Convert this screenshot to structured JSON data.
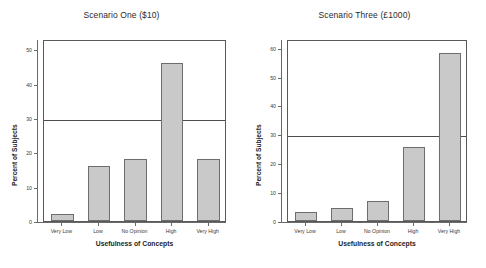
{
  "figure": {
    "width": 486,
    "height": 268,
    "background": "#ffffff",
    "bar_fill": "#c9c9c9",
    "bar_edge": "#6d6d6d",
    "axis_color": "#6a6a6a",
    "refline_color": "#4d4d4d"
  },
  "chart_data": [
    {
      "type": "bar",
      "title": "Scenario One ($10)",
      "xlabel": "Usefulness of Concepts",
      "ylabel": "Percent of Subjects",
      "categories": [
        "Very Low",
        "Low",
        "No Opinion",
        "High",
        "Very High"
      ],
      "values": [
        2,
        16,
        18,
        46,
        18
      ],
      "yticks": [
        0,
        10,
        20,
        30,
        40,
        50
      ],
      "ytick_labels": [
        "0",
        "10",
        "20",
        "30",
        "40",
        "50"
      ],
      "ylim": [
        0,
        53
      ],
      "grid": false,
      "legend": "none",
      "annotations": [
        {
          "type": "horizontal-reference-line",
          "value": 30
        }
      ]
    },
    {
      "type": "bar",
      "title": "Scenario Three (£1000)",
      "xlabel": "Usefulness of Concepts",
      "ylabel": "Percent of Subjects",
      "categories": [
        "Very Low",
        "Low",
        "No Opinion",
        "High",
        "Very High"
      ],
      "values": [
        3,
        4.5,
        7,
        25.5,
        58
      ],
      "yticks": [
        0,
        10,
        20,
        30,
        40,
        50,
        60
      ],
      "ytick_labels": [
        "0",
        "10",
        "20",
        "30",
        "40",
        "50",
        "60"
      ],
      "ylim": [
        0,
        63
      ],
      "grid": false,
      "legend": "none",
      "annotations": [
        {
          "type": "horizontal-reference-line",
          "value": 30
        }
      ]
    }
  ]
}
